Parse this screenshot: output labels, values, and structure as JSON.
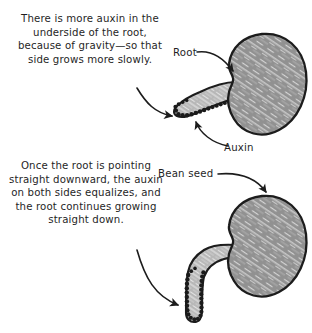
{
  "figure": {
    "background_color": "#ffffff",
    "ink_color": "#1f1f1f"
  },
  "captions": {
    "upper": "There is more auxin in the underside of the root, because of gravity—so that side grows more slowly.",
    "lower": "Once the root is pointing straight downward, the auxin on both sides equalizes, and the root continues growing straight down."
  },
  "labels": {
    "root": "Root",
    "auxin": "Auxin",
    "bean_seed": "Bean seed"
  },
  "colors": {
    "bean_fill": "#919191",
    "bean_highlight": "#d8d8d8",
    "root_fill": "#b9b9b9",
    "root_highlight": "#e2e2e2",
    "outline": "#1c1c1c",
    "auxin_dot": "#1a1a1a",
    "paper": "#ffffff"
  },
  "panels": [
    {
      "id": "panel-upper",
      "name": "tilted-root-panel",
      "description": "Bean seed with root angled down-left; auxin concentrated on the underside of the root.",
      "auxin_sides": "underside only",
      "root_direction": "down and to the left",
      "auxin_dot_count": 23
    },
    {
      "id": "panel-lower",
      "name": "vertical-root-panel",
      "description": "Bean seed with root curving down then pointing straight down; auxin equalized on both sides of the root tip.",
      "auxin_sides": "both sides",
      "root_direction": "straight down",
      "auxin_dot_count": 26
    }
  ],
  "icons": {
    "pointer_arrow": "curved-arrow-icon",
    "leader_line": "leader-line-icon"
  }
}
